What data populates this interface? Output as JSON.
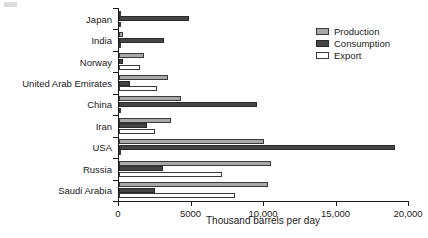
{
  "chart_data": {
    "type": "bar",
    "orientation": "horizontal",
    "title": "",
    "xlabel": "Thousand barrels per day",
    "ylabel": "",
    "xlim": [
      0,
      20000
    ],
    "xticks": [
      0,
      5000,
      10000,
      15000,
      20000
    ],
    "xtick_labels": [
      "0",
      "5000",
      "10,000",
      "15,000",
      "20,000"
    ],
    "grid": false,
    "legend_position": "top-right",
    "categories": [
      "Japan",
      "India",
      "Norway",
      "United Arab Emirates",
      "China",
      "Iran",
      "USA",
      "Russia",
      "Saudi Arabia"
    ],
    "series": [
      {
        "name": "Production",
        "color": "#a9a9a9",
        "values": [
          130,
          300,
          1700,
          3400,
          4300,
          3600,
          10000,
          10500,
          10300
        ]
      },
      {
        "name": "Consumption",
        "color": "#454545",
        "values": [
          4800,
          3100,
          250,
          750,
          9500,
          1900,
          19000,
          3000,
          2450
        ]
      },
      {
        "name": "Export",
        "color": "#ffffff",
        "values": [
          60,
          50,
          1480,
          2600,
          90,
          2500,
          40,
          7100,
          8000
        ]
      }
    ]
  },
  "legend": {
    "items": [
      {
        "label": "Production",
        "key": "production"
      },
      {
        "label": "Consumption",
        "key": "consumption"
      },
      {
        "label": "Export",
        "key": "export"
      }
    ]
  }
}
